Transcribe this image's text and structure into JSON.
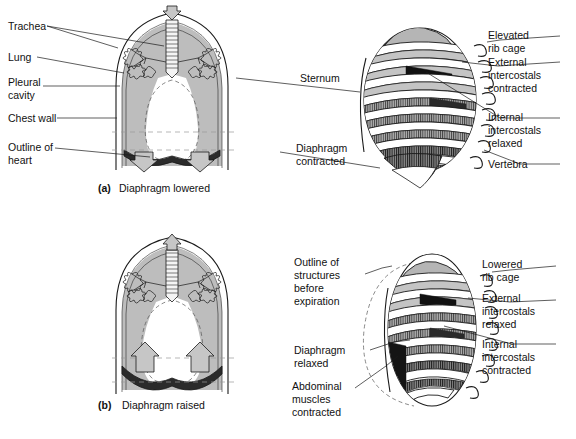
{
  "figure": {
    "caption": "",
    "background_color": "#ffffff",
    "ink_color": "#1a1a1a",
    "fill_gray": "#b9b9b9",
    "fill_gray_light": "#d2d2d2",
    "fill_dark": "#1c1c1c"
  },
  "panel_a": {
    "caption_marker": "(a)",
    "caption_text": "Diaphragm lowered",
    "labels": [
      {
        "id": "trachea",
        "text": "Trachea",
        "lines": [
          "Trachea"
        ]
      },
      {
        "id": "lung",
        "text": "Lung",
        "lines": [
          "Lung"
        ]
      },
      {
        "id": "pleural-cavity",
        "text": "Pleural cavity",
        "lines": [
          "Pleural",
          "cavity"
        ]
      },
      {
        "id": "chest-wall",
        "text": "Chest wall",
        "lines": [
          "Chest wall"
        ]
      },
      {
        "id": "outline-of-heart",
        "text": "Outline of heart",
        "lines": [
          "Outline of",
          "heart"
        ]
      }
    ]
  },
  "panel_b": {
    "caption_marker": "(b)",
    "caption_text": "Diaphragm raised",
    "labels": []
  },
  "panel_c": {
    "labels": [
      {
        "id": "sternum",
        "text": "Sternum",
        "lines": [
          "Sternum"
        ]
      },
      {
        "id": "diaphragm-contracted",
        "text": "Diaphragm contracted",
        "lines": [
          "Diaphragm",
          "contracted"
        ]
      },
      {
        "id": "elevated-rib-cage",
        "text": "Elevated rib cage",
        "lines": [
          "Elevated",
          "rib cage"
        ]
      },
      {
        "id": "external-intercostals-contracted",
        "text": "External intercostals contracted",
        "lines": [
          "External",
          "intercostals",
          "contracted"
        ]
      },
      {
        "id": "internal-intercostals-relaxed",
        "text": "Internal intercostals relaxed",
        "lines": [
          "Internal",
          "intercostals",
          "relaxed"
        ]
      },
      {
        "id": "vertebra",
        "text": "Vertebra",
        "lines": [
          "Vertebra"
        ]
      }
    ]
  },
  "panel_d": {
    "labels": [
      {
        "id": "outline-of-structures-before-expiration",
        "text": "Outline of structures before expiration",
        "lines": [
          "Outline of",
          "structures",
          "before",
          "expiration"
        ]
      },
      {
        "id": "diaphragm-relaxed",
        "text": "Diaphragm relaxed",
        "lines": [
          "Diaphragm",
          "relaxed"
        ]
      },
      {
        "id": "abdominal-muscles-contracted",
        "text": "Abdominal muscles contracted",
        "lines": [
          "Abdominal",
          "muscles",
          "contracted"
        ]
      },
      {
        "id": "lowered-rib-cage",
        "text": "Lowered rib cage",
        "lines": [
          "Lowered",
          "rib cage"
        ]
      },
      {
        "id": "external-intercostals-relaxed",
        "text": "External intercostals relaxed",
        "lines": [
          "External",
          "intercostals",
          "relaxed"
        ]
      },
      {
        "id": "internal-intercostals-contracted",
        "text": "Internal intercostals contracted",
        "lines": [
          "Internal",
          "intercostals",
          "contracted"
        ]
      }
    ]
  }
}
